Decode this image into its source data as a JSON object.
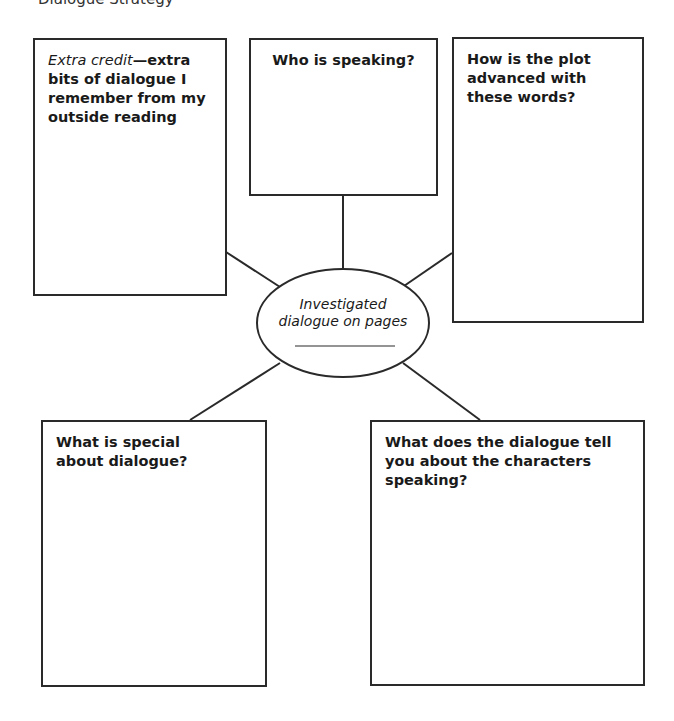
{
  "header": {
    "clipped_text": "Dialogue Strategy"
  },
  "center": {
    "label_line1": "Investigated",
    "label_line2": "dialogue on pages",
    "blank": ""
  },
  "boxes": {
    "extra_credit": {
      "italic_lead": "Extra credit",
      "text": "—extra bits of dialogue I remember from my outside reading"
    },
    "who": {
      "text": "Who is speaking?"
    },
    "plot": {
      "text": "How is the plot advanced with these words?"
    },
    "special": {
      "text": "What is special about dialogue?"
    },
    "characters": {
      "text": "What does the dialogue tell you about the characters speaking?"
    }
  },
  "colors": {
    "stroke": "#2a2a2a",
    "background": "#ffffff"
  }
}
